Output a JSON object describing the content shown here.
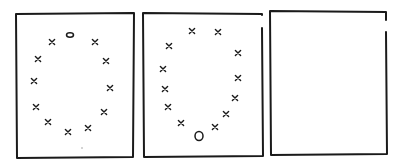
{
  "diagram": {
    "type": "sequence-puzzle",
    "stroke_color": "#1a1a1a",
    "background": "#ffffff",
    "panels": [
      {
        "id": "panel-1",
        "frame": {
          "x1": 16,
          "y1": 14,
          "x2": 134,
          "y2": 157
        },
        "x_marks": [
          [
            52,
            42
          ],
          [
            95,
            42
          ],
          [
            38,
            59
          ],
          [
            106,
            61
          ],
          [
            34,
            81
          ],
          [
            110,
            88
          ],
          [
            36,
            107
          ],
          [
            104,
            112
          ],
          [
            48,
            122
          ],
          [
            88,
            128
          ],
          [
            68,
            132
          ]
        ],
        "o_marks": [
          {
            "x": 70,
            "y": 35,
            "rx": 3.5,
            "ry": 2.2
          }
        ],
        "dots": [
          [
            82,
            148
          ]
        ]
      },
      {
        "id": "panel-2",
        "frame": {
          "x1": 143,
          "y1": 13,
          "x2": 262,
          "y2": 156,
          "right_gap": [
            15,
            28
          ]
        },
        "x_marks": [
          [
            192,
            31
          ],
          [
            218,
            32
          ],
          [
            169,
            46
          ],
          [
            238,
            53
          ],
          [
            163,
            69
          ],
          [
            238,
            78
          ],
          [
            165,
            89
          ],
          [
            235,
            98
          ],
          [
            168,
            107
          ],
          [
            226,
            114
          ],
          [
            181,
            123
          ],
          [
            215,
            127
          ]
        ],
        "o_marks": [
          {
            "x": 199,
            "y": 136,
            "rx": 4,
            "ry": 4.5
          }
        ],
        "dots": []
      },
      {
        "id": "panel-3",
        "frame": {
          "x1": 270,
          "y1": 11,
          "x2": 386,
          "y2": 154,
          "right_gap": [
            20,
            32
          ]
        },
        "x_marks": [],
        "o_marks": [],
        "dots": []
      }
    ]
  }
}
